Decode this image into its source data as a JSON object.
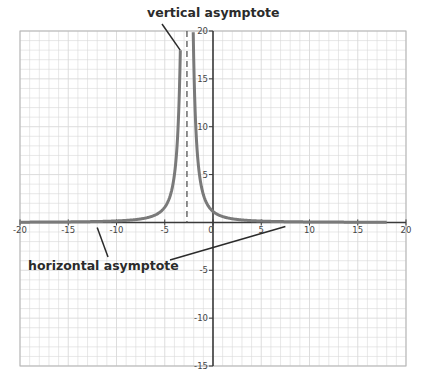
{
  "chart_data": {
    "type": "line",
    "title": "",
    "xlabel": "",
    "ylabel": "",
    "xlim": [
      -20,
      20
    ],
    "ylim": [
      -15,
      20
    ],
    "grid": true,
    "grid_step": 1,
    "x_ticks": [
      -20,
      -15,
      -10,
      -5,
      0,
      5,
      10,
      15,
      20
    ],
    "x_tick_labels": [
      "-20",
      "-15",
      "-10",
      "-5",
      "0",
      "5",
      "10",
      "15",
      "20"
    ],
    "y_ticks": [
      -15,
      -10,
      -5,
      5,
      10,
      15,
      20
    ],
    "y_tick_labels": [
      "-15",
      "-10",
      "-5",
      "5",
      "10",
      "15",
      "20"
    ],
    "series": [
      {
        "name": "curve",
        "formula": "y = 8.4 / (x + 2.7)^2",
        "k": 8.4,
        "asymptote_x": -2.7,
        "x_range": [
          -20,
          18
        ],
        "color": "#7a7a7a",
        "samples": [
          {
            "x": -20,
            "y": 0.03
          },
          {
            "x": -15,
            "y": 0.06
          },
          {
            "x": -10,
            "y": 0.16
          },
          {
            "x": -7,
            "y": 0.45
          },
          {
            "x": -5,
            "y": 1.59
          },
          {
            "x": -4,
            "y": 4.97
          },
          {
            "x": -3.35,
            "y": 19.9
          },
          {
            "x": -2.05,
            "y": 19.9
          },
          {
            "x": -1.5,
            "y": 5.83
          },
          {
            "x": 0,
            "y": 1.15
          },
          {
            "x": 2,
            "y": 0.38
          },
          {
            "x": 5,
            "y": 0.14
          },
          {
            "x": 10,
            "y": 0.05
          },
          {
            "x": 15,
            "y": 0.03
          },
          {
            "x": 18,
            "y": 0.02
          }
        ]
      }
    ],
    "asymptotes": [
      {
        "type": "vertical",
        "x": -2.7,
        "style": "dashed"
      },
      {
        "type": "horizontal",
        "y": 0
      }
    ],
    "annotations": [
      {
        "text": "vertical asymptote",
        "points_to": {
          "x": -3.4,
          "y": 18
        }
      },
      {
        "text": "horizontal asymptote",
        "points_to": [
          {
            "x": -12,
            "y": 0
          },
          {
            "x": 7.5,
            "y": 0
          }
        ]
      }
    ]
  },
  "labels": {
    "vertical_asymptote": "vertical asymptote",
    "horizontal_asymptote": "horizontal asymptote"
  },
  "colors": {
    "grid": "#d9d9d9",
    "axis": "#3a3a3a",
    "curve": "#7a7a7a",
    "asymptote": "#555555",
    "annotation": "#2b2b2b"
  }
}
